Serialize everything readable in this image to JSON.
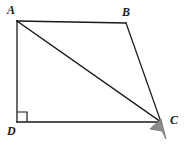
{
  "figure": {
    "background_color": "#ffffff",
    "stroke_color": "#1a1a1a",
    "stroke_width": 1.3,
    "labels": {
      "a": "A",
      "b": "B",
      "c": "C",
      "d": "D"
    },
    "vertices": {
      "A": {
        "x": 17,
        "y": 21
      },
      "B": {
        "x": 126,
        "y": 23
      },
      "C": {
        "x": 161,
        "y": 122
      },
      "D": {
        "x": 17,
        "y": 122
      }
    },
    "edges": [
      {
        "name": "AB",
        "from": "A",
        "to": "B"
      },
      {
        "name": "BC",
        "from": "B",
        "to": "C"
      },
      {
        "name": "CD",
        "from": "C",
        "to": "D"
      },
      {
        "name": "DA",
        "from": "D",
        "to": "A"
      },
      {
        "name": "AC",
        "from": "A",
        "to": "C"
      }
    ],
    "right_angle_marker": {
      "at_vertex": "D",
      "size": 10,
      "label": "right angle at D"
    },
    "cursor": {
      "name": "mouse-pointer",
      "color": "#8c8c8c",
      "outline_color": "#6e6e6e",
      "tip_x": 161,
      "tip_y": 120
    }
  }
}
